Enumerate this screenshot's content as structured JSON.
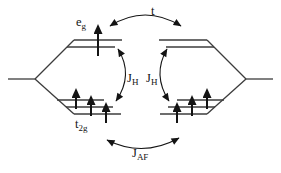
{
  "labels": {
    "eg": {
      "base": "e",
      "sub": "g"
    },
    "t2g": {
      "base": "t",
      "sub": "2g"
    },
    "hopping_t": "t",
    "jh_left": {
      "base": "J",
      "sub": "H"
    },
    "jh_right": {
      "base": "J",
      "sub": "H"
    },
    "jaf": {
      "base": "J",
      "sub": "AF"
    }
  },
  "electrons": {
    "left_site": {
      "eg_arrows": 1,
      "eg_spin": "up",
      "t2g_arrows": 3,
      "t2g_spin": "up"
    },
    "right_site": {
      "eg_arrows": 0,
      "t2g_arrows": 3,
      "t2g_spin": "up"
    }
  },
  "colors": {
    "background": "#ffffff",
    "lines": "#3c3c3c",
    "arrows": "#141414",
    "text": "#141414"
  }
}
